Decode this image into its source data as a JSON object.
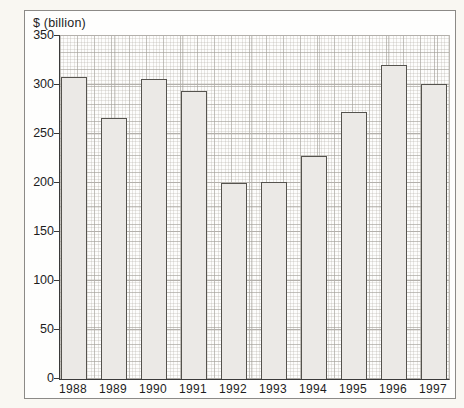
{
  "chart_data": {
    "type": "bar",
    "title": "",
    "ylabel": "$ (billion)",
    "xlabel": "",
    "categories": [
      "1988",
      "1989",
      "1990",
      "1991",
      "1992",
      "1993",
      "1994",
      "1995",
      "1996",
      "1997"
    ],
    "values": [
      308,
      266,
      306,
      293,
      200,
      201,
      227,
      272,
      320,
      301
    ],
    "ylim": [
      0,
      350
    ],
    "yticks": [
      0,
      50,
      100,
      150,
      200,
      250,
      300,
      350
    ],
    "grid": "graph-paper minor grid with major horizontal lines every 50",
    "legend": "none",
    "colors": {
      "bar_fill": "#ebe9e6",
      "bar_border": "#55534e",
      "axis": "#3a3a3a",
      "panel_border": "#8c8a87",
      "grid_major": "#b3b0ab",
      "text": "#1d1d1d",
      "plot_background": "#fdfdfc"
    }
  }
}
